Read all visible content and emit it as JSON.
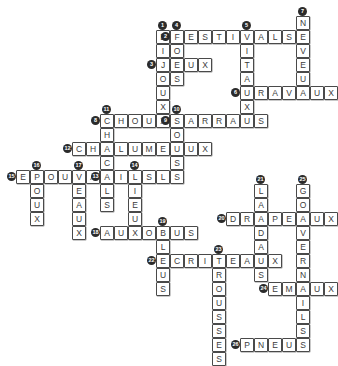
{
  "puzzle": {
    "title": "Mots croises - Pluriels en -X et -S",
    "cell_size": 14,
    "grid_origin_x": 2,
    "grid_origin_y": 2,
    "letter_color": "#3b3b3b",
    "cell_border_color": "#4a4a4a",
    "clue_badge_color": "#2b2b2b",
    "background_color": "#ffffff"
  },
  "entries": [
    {
      "number": "1",
      "answer": "BIJOUX",
      "direction": "down",
      "col": 11,
      "row": 2
    },
    {
      "number": "2",
      "answer": "FESTIVALS",
      "direction": "across",
      "col": 12,
      "row": 2
    },
    {
      "number": "3",
      "answer": "JEUX",
      "direction": "across",
      "col": 11,
      "row": 4
    },
    {
      "number": "4",
      "answer": "FOUS",
      "direction": "down",
      "col": 12,
      "row": 2
    },
    {
      "number": "5",
      "answer": "VITAUX",
      "direction": "down",
      "col": 17,
      "row": 2
    },
    {
      "number": "6",
      "answer": "TRAVAUX",
      "direction": "across",
      "col": 17,
      "row": 6
    },
    {
      "number": "7",
      "answer": "NEVEUX",
      "direction": "down",
      "col": 21,
      "row": 1
    },
    {
      "number": "8",
      "answer": "CHOUX",
      "direction": "across",
      "col": 7,
      "row": 8
    },
    {
      "number": "9",
      "answer": "SARRAUS",
      "direction": "across",
      "col": 12,
      "row": 8
    },
    {
      "number": "10",
      "answer": "SOUS",
      "direction": "down",
      "col": 12,
      "row": 8
    },
    {
      "number": "11",
      "answer": "CHACALS",
      "direction": "down",
      "col": 7,
      "row": 8
    },
    {
      "number": "12",
      "answer": "CHALUMEAUX",
      "direction": "across",
      "col": 5,
      "row": 10
    },
    {
      "number": "13",
      "answer": "AILS",
      "direction": "across",
      "col": 7,
      "row": 12
    },
    {
      "number": "14",
      "answer": "LIEUX",
      "direction": "down",
      "col": 9,
      "row": 12
    },
    {
      "number": "15",
      "answer": "EPOUVANTAILS",
      "direction": "across",
      "col": 1,
      "row": 12
    },
    {
      "number": "16",
      "answer": "POUX",
      "direction": "down",
      "col": 2,
      "row": 12
    },
    {
      "number": "17",
      "answer": "VEAUX",
      "direction": "down",
      "col": 5,
      "row": 12
    },
    {
      "number": "18",
      "answer": "AUTOBUS",
      "direction": "across",
      "col": 7,
      "row": 16
    },
    {
      "number": "19",
      "answer": "BLEUS",
      "direction": "down",
      "col": 11,
      "row": 16
    },
    {
      "number": "20",
      "answer": "DRAPEAUX",
      "direction": "across",
      "col": 16,
      "row": 15
    },
    {
      "number": "21",
      "answer": "LANDAUS",
      "direction": "down",
      "col": 18,
      "row": 13
    },
    {
      "number": "22",
      "answer": "ECRITEAUX",
      "direction": "across",
      "col": 11,
      "row": 18
    },
    {
      "number": "23",
      "answer": "TROUSSES",
      "direction": "down",
      "col": 15,
      "row": 18
    },
    {
      "number": "24",
      "answer": "EMAUX",
      "direction": "across",
      "col": 19,
      "row": 20
    },
    {
      "number": "25",
      "answer": "GOUVERNAILS",
      "direction": "down",
      "col": 21,
      "row": 13
    },
    {
      "number": "26",
      "answer": "PNEUS",
      "direction": "across",
      "col": 17,
      "row": 24
    }
  ]
}
